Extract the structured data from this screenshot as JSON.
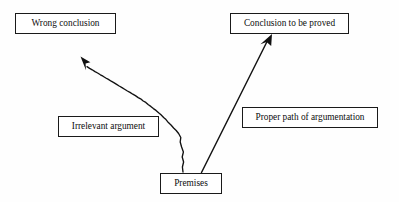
{
  "diagram": {
    "type": "flow-diagram",
    "background_color": "#fefefe",
    "stroke_color": "#111111",
    "text_color": "#0d0d0d",
    "nodes": [
      {
        "id": "wrong-conclusion",
        "label": "Wrong conclusion",
        "shape": "rectangle",
        "x": 15,
        "y": 13,
        "width": 101,
        "height": 21
      },
      {
        "id": "conclusion-proved",
        "label": "Conclusion to be proved",
        "shape": "rectangle",
        "x": 230,
        "y": 13,
        "width": 119,
        "height": 21
      },
      {
        "id": "irrelevant-argument",
        "label": "Irrelevant argument",
        "shape": "rectangle",
        "x": 58,
        "y": 116,
        "width": 101,
        "height": 21
      },
      {
        "id": "proper-path",
        "label": "Proper path of argumentation",
        "shape": "rectangle",
        "x": 242,
        "y": 107,
        "width": 136,
        "height": 21
      },
      {
        "id": "premises",
        "label": "Premises",
        "shape": "rectangle",
        "x": 160,
        "y": 173,
        "width": 62,
        "height": 21
      }
    ],
    "edges": [
      {
        "id": "edge-irrelevant",
        "from": "premises",
        "to": "wrong-conclusion",
        "style": "wavy",
        "arrowhead": "filled-triangle",
        "annotated_by": "irrelevant-argument"
      },
      {
        "id": "edge-proper",
        "from": "premises",
        "to": "conclusion-proved",
        "style": "straight",
        "arrowhead": "filled-triangle",
        "annotated_by": "proper-path"
      }
    ]
  }
}
